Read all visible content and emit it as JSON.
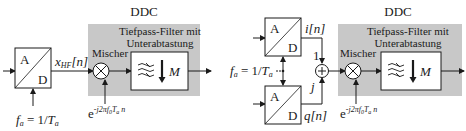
{
  "colors": {
    "ddc_block": "#c8c8c8",
    "stroke": "#1a1a1a",
    "box_fill": "#ffffff",
    "background": "#ffffff"
  },
  "left_diagram": {
    "adc": {
      "top_label": "A",
      "bottom_label": "D"
    },
    "signal_label": {
      "base": "x",
      "sub": "HF",
      "suffix": "[n]"
    },
    "ddc": {
      "title": "DDC",
      "mixer_label": "Mischer",
      "filter_title_line1": "Tiefpass-Filter mit",
      "filter_title_line2": "Unterabtastung",
      "decimation_label": "M"
    },
    "clock": {
      "f": "f",
      "f_sub": "a",
      "eq": " = 1/",
      "T": "T",
      "T_sub": "a"
    },
    "lo": {
      "base": "e",
      "exp": "-j2πf",
      "exp_sub0": "0",
      "exp_T": "T",
      "exp_sub_a": "a",
      "exp_n": " n"
    }
  },
  "right_diagram": {
    "adc_i": {
      "top_label": "A",
      "bottom_label": "D"
    },
    "adc_q": {
      "top_label": "A",
      "bottom_label": "D"
    },
    "i_label": "i[n]",
    "q_label": "q[n]",
    "i_weight": "1",
    "q_weight": "j",
    "adder_symbol": "+",
    "clock": {
      "f": "f",
      "f_sub": "a",
      "eq": " = 1/",
      "T": "T",
      "T_sub": "a"
    },
    "ddc": {
      "title": "DDC",
      "mixer_label": "Mischer",
      "filter_title_line1": "Tiefpass-Filter mit",
      "filter_title_line2": "Unterabtastung",
      "decimation_label": "M"
    },
    "lo": {
      "base": "e",
      "exp": "-j2πf",
      "exp_sub0": "0",
      "exp_T": "T",
      "exp_sub_a": "a",
      "exp_n": " n"
    }
  }
}
